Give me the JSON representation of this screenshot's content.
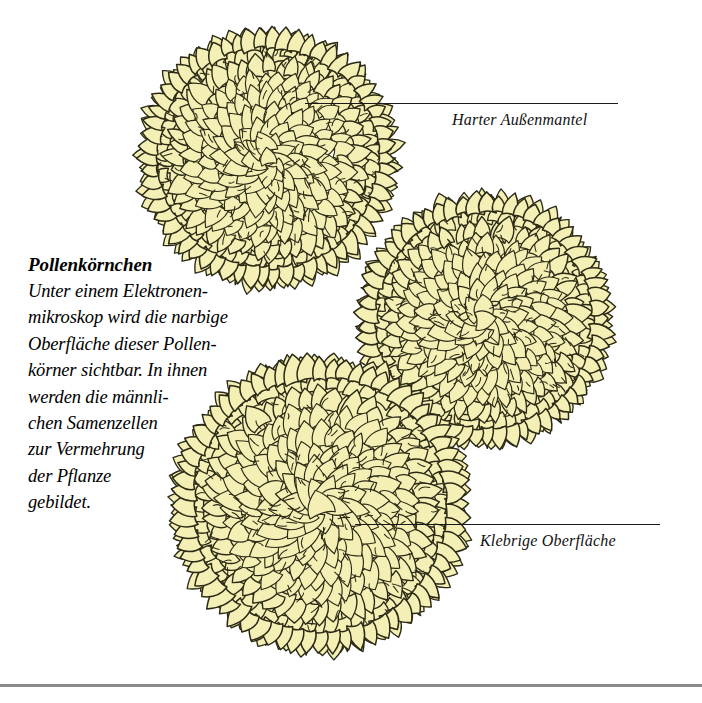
{
  "page": {
    "background_color": "#ffffff",
    "width": 702,
    "height": 703
  },
  "caption": {
    "title": "Pollenkörnchen",
    "lines": [
      "Unter einem Elektronen-",
      "mikroskop wird die narbige",
      "Oberfläche dieser Pollen-",
      "körner sichtbar. In ihnen",
      "werden die männli-",
      "chen Samenzellen",
      "zur Vermehrung",
      "der Pflanze",
      "gebildet."
    ],
    "full_text": "Unter einem Elektronenmikroskop wird die narbige Oberfläche dieser Pollenkörner sichtbar. In ihnen werden die männlichen Samenzellen zur Vermehrung der Pflanze gebildet."
  },
  "callouts": [
    {
      "id": "outer-coat",
      "label": "Harter Außenmantel",
      "leader_from_x": 305,
      "leader_to_x": 618,
      "leader_y": 103
    },
    {
      "id": "sticky-surface",
      "label": "Klebrige Oberfläche",
      "leader_from_x": 355,
      "leader_to_x": 660,
      "leader_y": 524
    }
  ],
  "illustration": {
    "subject": "pollen-grains",
    "count": 3,
    "grain_fill_color": "#f4f0b5",
    "grain_outline_color": "#2b2a16",
    "spike_shading_color": "#c9c384",
    "grains": [
      {
        "name": "pollen-grain-top-left",
        "cx": 268,
        "cy": 158,
        "r": 126,
        "spikes": 62,
        "seed": 11
      },
      {
        "name": "pollen-grain-middle-right",
        "cx": 484,
        "cy": 320,
        "r": 124,
        "spikes": 61,
        "seed": 27
      },
      {
        "name": "pollen-grain-bottom-left",
        "cx": 320,
        "cy": 505,
        "r": 145,
        "spikes": 68,
        "seed": 43
      }
    ]
  },
  "bottom_rule": {
    "color": "#8a8a8a",
    "y": 684
  }
}
